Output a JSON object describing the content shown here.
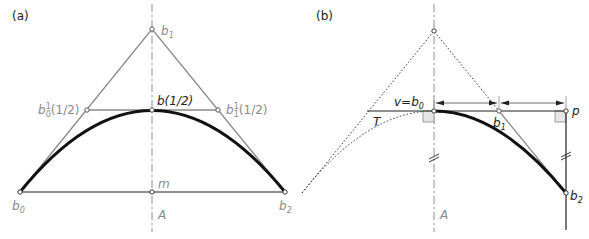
{
  "panel_a": {
    "tag": "(a)",
    "labels": {
      "b1": "b",
      "b1_sub": "1",
      "b_half": "b(1/2)",
      "b0_1": "b",
      "b0_1_sub": "0",
      "b0_1_sup": "1",
      "b0_1_arg": "(1/2)",
      "b1_1": "b",
      "b1_1_sub": "1",
      "b1_1_sup": "1",
      "b1_1_arg": "(1/2)",
      "m": "m",
      "b0": "b",
      "b0_sub": "0",
      "b2": "b",
      "b2_sub": "2",
      "axis": "A"
    }
  },
  "panel_b": {
    "tag": "(b)",
    "labels": {
      "v_eq": "v=b",
      "v_eq_sub": "0",
      "T": "T",
      "b1": "b",
      "b1_sub": "1",
      "p": "p",
      "b2": "b",
      "b2_sub": "2",
      "axis": "A"
    }
  },
  "colors": {
    "curve": "#111111",
    "control_polygon": "#8a8a8a",
    "axis": "#8a8a8a",
    "right_angle_fill": "#e6e6e6"
  }
}
